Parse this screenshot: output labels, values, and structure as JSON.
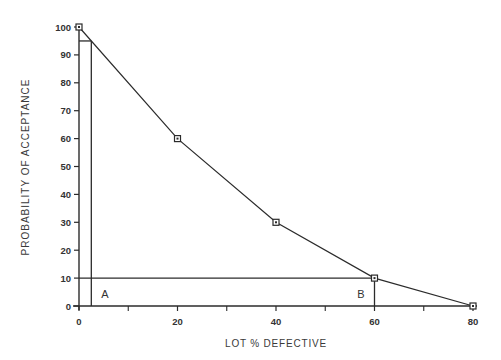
{
  "chart_data": {
    "type": "line",
    "title": "",
    "xlabel": "LOT % DEFECTIVE",
    "ylabel": "PROBABILITY  OF  ACCEPTANCE",
    "xlim": [
      0,
      80
    ],
    "ylim": [
      0,
      100
    ],
    "x_ticks": [
      0,
      20,
      40,
      60,
      80
    ],
    "x_minor_ticks": [
      10,
      30,
      50,
      70
    ],
    "y_ticks": [
      0,
      10,
      20,
      30,
      40,
      50,
      60,
      70,
      80,
      90,
      100
    ],
    "grid": false,
    "legend": null,
    "series": [
      {
        "name": "OC curve",
        "x": [
          0,
          20,
          40,
          60,
          80
        ],
        "y": [
          100,
          60,
          30,
          10,
          0
        ],
        "marker": "square"
      }
    ],
    "reference_lines": [
      {
        "label": "A",
        "description": "Vertical at x≈2.5 from y=0 to y=95, horizontal at y=95 from x=0 to x≈2.5",
        "x": 2.5,
        "y": 95
      },
      {
        "label": "B",
        "description": "Horizontal at y=10 from x=0 to x=60, vertical at x=60 from y=0 to y=10",
        "x": 60,
        "y": 10
      }
    ],
    "annotations": [
      {
        "text": "A",
        "x": 4.5,
        "y": 4
      },
      {
        "text": "B",
        "x": 56.5,
        "y": 4
      }
    ]
  },
  "labels": {
    "xlabel": "LOT % DEFECTIVE",
    "ylabel": "PROBABILITY  OF  ACCEPTANCE"
  }
}
